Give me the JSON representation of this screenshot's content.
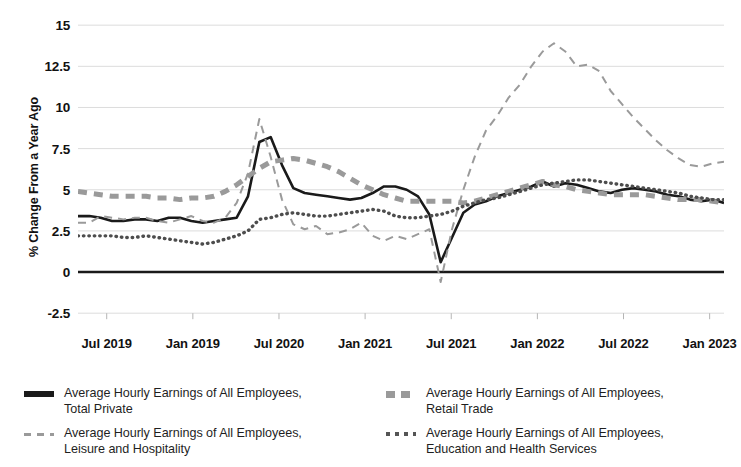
{
  "chart_data": {
    "type": "line",
    "title": "",
    "xlabel": "",
    "ylabel": "% Change From a Year Ago",
    "ylim": [
      -3.4,
      15.8
    ],
    "yticks": [
      15,
      12.5,
      10,
      7.5,
      5,
      2.5,
      0,
      -2.5
    ],
    "ytick_labels": [
      "15",
      "12.5",
      "10",
      "7.5",
      "5",
      "2.5",
      "0",
      "-2.5"
    ],
    "xtick_labels": [
      "Jul 2019",
      "Jan 2019",
      "Jul 2020",
      "Jan 2021",
      "Jul 2021",
      "Jan 2022",
      "Jul 2022",
      "Jan 2023"
    ],
    "xtick_positions": [
      2,
      8,
      14,
      20,
      26,
      32,
      38,
      44
    ],
    "xlim": [
      0,
      45
    ],
    "grid": true,
    "zero_line": true,
    "legend_position": "bottom",
    "legend_columns": 2,
    "series": [
      {
        "name": "Average Hourly Earnings of All Employees, Total Private",
        "style": "solid",
        "color": "#1a1a1a",
        "width": 2.6,
        "values": [
          3.4,
          3.4,
          3.3,
          3.1,
          3.1,
          3.2,
          3.2,
          3.1,
          3.3,
          3.3,
          3.1,
          3.0,
          3.1,
          3.2,
          3.3,
          4.6,
          7.9,
          8.2,
          6.5,
          5.1,
          4.8,
          4.7,
          4.6,
          4.5,
          4.4,
          4.5,
          4.8,
          5.2,
          5.2,
          5.0,
          4.6,
          3.5,
          0.6,
          2.1,
          3.6,
          4.1,
          4.3,
          4.6,
          4.8,
          5.0,
          5.2,
          5.5,
          5.2,
          5.4,
          5.3,
          5.1,
          4.9,
          4.8,
          5.0,
          5.1,
          5.0,
          4.9,
          4.7,
          4.6,
          4.4,
          4.3,
          4.4,
          4.2
        ]
      },
      {
        "name": "Average Hourly Earnings of All Employees, Leisure and Hospitality",
        "style": "dashed-thin",
        "color": "#9a9a9a",
        "width": 2.0,
        "values": [
          3.0,
          3.0,
          3.4,
          3.3,
          3.2,
          3.3,
          3.3,
          3.1,
          3.0,
          3.2,
          3.4,
          3.1,
          3.0,
          3.3,
          4.2,
          6.0,
          9.3,
          7.0,
          4.4,
          2.9,
          2.6,
          2.8,
          2.3,
          2.4,
          2.6,
          3.0,
          2.2,
          1.9,
          2.2,
          2.0,
          2.3,
          2.6,
          -0.6,
          2.6,
          5.0,
          7.0,
          8.6,
          9.5,
          10.6,
          11.4,
          12.5,
          13.4,
          13.9,
          13.4,
          12.5,
          12.6,
          12.2,
          11.0,
          10.2,
          9.4,
          8.7,
          8.0,
          7.4,
          6.9,
          6.5,
          6.4,
          6.6,
          6.7
        ]
      },
      {
        "name": "Average Hourly Earnings of All Employees, Retail Trade",
        "style": "dashed-bold",
        "color": "#9a9a9a",
        "width": 5.0,
        "values": [
          4.9,
          4.8,
          4.7,
          4.6,
          4.6,
          4.6,
          4.6,
          4.5,
          4.5,
          4.4,
          4.5,
          4.5,
          4.6,
          4.9,
          5.3,
          5.8,
          6.3,
          6.7,
          6.8,
          6.9,
          6.8,
          6.6,
          6.4,
          6.1,
          5.7,
          5.3,
          5.0,
          4.7,
          4.5,
          4.3,
          4.3,
          4.3,
          4.3,
          4.3,
          4.2,
          4.3,
          4.5,
          4.7,
          4.9,
          5.1,
          5.3,
          5.5,
          5.3,
          5.2,
          5.0,
          4.9,
          4.8,
          4.7,
          4.7,
          4.7,
          4.7,
          4.6,
          4.5,
          4.4,
          4.4,
          4.4,
          4.3,
          4.2
        ]
      },
      {
        "name": "Average Hourly Earnings of All Employees, Education and Health Services",
        "style": "dotted",
        "color": "#4d4d4d",
        "width": 3.4,
        "values": [
          2.2,
          2.2,
          2.2,
          2.2,
          2.1,
          2.1,
          2.2,
          2.1,
          2.0,
          1.9,
          1.8,
          1.7,
          1.8,
          2.0,
          2.2,
          2.5,
          3.2,
          3.3,
          3.5,
          3.6,
          3.5,
          3.4,
          3.4,
          3.5,
          3.6,
          3.7,
          3.8,
          3.7,
          3.4,
          3.3,
          3.3,
          3.4,
          3.5,
          3.7,
          4.0,
          4.2,
          4.4,
          4.5,
          4.7,
          4.9,
          5.1,
          5.3,
          5.4,
          5.5,
          5.6,
          5.6,
          5.5,
          5.4,
          5.3,
          5.2,
          5.1,
          5.0,
          4.9,
          4.8,
          4.6,
          4.5,
          4.4,
          4.4
        ]
      }
    ]
  },
  "axis": {
    "ylabel": "% Change From a Year Ago"
  },
  "legend": {
    "entries": [
      {
        "label_line1": "Average Hourly Earnings of All Employees,",
        "label_line2": "Total Private",
        "icon": "solid-line-swatch"
      },
      {
        "label_line1": "Average Hourly Earnings of All Employees,",
        "label_line2": "Leisure and Hospitality",
        "icon": "thin-dashed-line-swatch"
      },
      {
        "label_line1": "Average Hourly Earnings of All Employees,",
        "label_line2": "Retail Trade",
        "icon": "bold-dashed-line-swatch"
      },
      {
        "label_line1": "Average Hourly Earnings of All Employees,",
        "label_line2": "Education and Health Services",
        "icon": "dotted-line-swatch"
      }
    ]
  },
  "colors": {
    "solid": "#1a1a1a",
    "dashed": "#9a9a9a",
    "dotted": "#4d4d4d",
    "grid": "#dcdcdc",
    "axis": "#1a1a1a",
    "background": "#ffffff"
  }
}
